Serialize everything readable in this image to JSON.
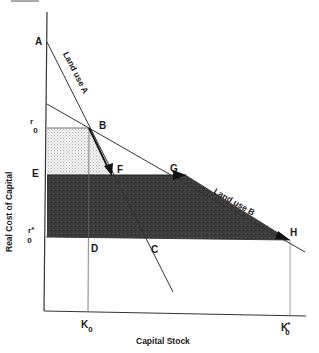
{
  "figure": {
    "x_axis_title": "Capital Stock",
    "y_axis_title": "Real Cost of Capital",
    "curves": [
      {
        "name": "Land use A",
        "label": "Land use A"
      },
      {
        "name": "Land use B",
        "label": "Land use B"
      }
    ],
    "points": {
      "A": "A",
      "B": "B",
      "C": "C",
      "D": "D",
      "E": "E",
      "F": "F",
      "G": "G",
      "H": "H"
    },
    "y_ticks": {
      "r0": {
        "main": "r",
        "sub": "0"
      },
      "r0_star": {
        "main": "r",
        "sup": "*",
        "sub": "0"
      }
    },
    "x_ticks": {
      "K0": {
        "main": "K",
        "sub": "0"
      },
      "K0_star": {
        "main": "K",
        "sup": "*",
        "sub": "0"
      }
    },
    "colors": {
      "line": "#333333",
      "light_shade": "#e4e4e4",
      "dark_shade": "#3a3a3a"
    }
  }
}
